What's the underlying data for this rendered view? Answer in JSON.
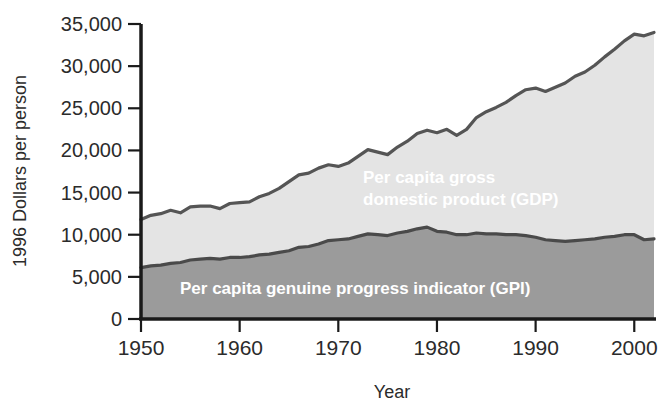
{
  "chart_data": {
    "type": "area",
    "title": "",
    "subtitle": "",
    "xlabel": "Year",
    "ylabel": "1996 Dollars per person",
    "xlim": [
      1950,
      2002
    ],
    "ylim": [
      0,
      35000
    ],
    "grid": false,
    "legend_position": "inline-annotations",
    "ytick_labels": [
      "35,000",
      "30,000",
      "25,000",
      "20,000",
      "15,000",
      "10,000",
      "5,000",
      "0"
    ],
    "ytick_values": [
      35000,
      30000,
      25000,
      20000,
      15000,
      10000,
      5000,
      0
    ],
    "xtick_labels": [
      "1950",
      "1960",
      "1970",
      "1980",
      "1990",
      "2000"
    ],
    "xtick_values": [
      1950,
      1960,
      1970,
      1980,
      1990,
      2000
    ],
    "colors": {
      "gdp_fill": "#e6e6e6",
      "gpi_fill": "#9b9b9b",
      "line": "#4a4a4a",
      "axis": "#1a1a1a",
      "label_text": "#ffffff",
      "tick_text": "#2b2b2b"
    },
    "x": [
      1950,
      1951,
      1952,
      1953,
      1954,
      1955,
      1956,
      1957,
      1958,
      1959,
      1960,
      1961,
      1962,
      1963,
      1964,
      1965,
      1966,
      1967,
      1968,
      1969,
      1970,
      1971,
      1972,
      1973,
      1974,
      1975,
      1976,
      1977,
      1978,
      1979,
      1980,
      1981,
      1982,
      1983,
      1984,
      1985,
      1986,
      1987,
      1988,
      1989,
      1990,
      1991,
      1992,
      1993,
      1994,
      1995,
      1996,
      1997,
      1998,
      1999,
      2000,
      2001,
      2002
    ],
    "series": [
      {
        "name": "Per capita gross domestic product (GDP)",
        "label_lines": [
          "Per capita gross",
          "domestic product (GDP)"
        ],
        "values": [
          11800,
          12300,
          12500,
          12900,
          12600,
          13300,
          13400,
          13400,
          13100,
          13700,
          13800,
          13900,
          14500,
          14900,
          15500,
          16300,
          17100,
          17300,
          17900,
          18300,
          18100,
          18500,
          19300,
          20100,
          19800,
          19500,
          20400,
          21100,
          22000,
          22400,
          22100,
          22500,
          21800,
          22500,
          23900,
          24600,
          25100,
          25700,
          26500,
          27200,
          27400,
          27000,
          27500,
          28000,
          28800,
          29300,
          30100,
          31100,
          32000,
          33000,
          33800,
          33600,
          34000
        ]
      },
      {
        "name": "Per capita genuine progress indicator (GPI)",
        "label_lines": [
          "Per capita genuine progress indicator (GPI)"
        ],
        "values": [
          6100,
          6300,
          6400,
          6600,
          6700,
          7000,
          7100,
          7200,
          7100,
          7300,
          7300,
          7400,
          7600,
          7700,
          7900,
          8100,
          8500,
          8600,
          8900,
          9300,
          9400,
          9500,
          9800,
          10100,
          10000,
          9900,
          10200,
          10400,
          10700,
          10900,
          10400,
          10300,
          10000,
          10000,
          10200,
          10100,
          10100,
          10000,
          10000,
          9900,
          9700,
          9400,
          9300,
          9200,
          9300,
          9400,
          9500,
          9700,
          9800,
          10000,
          10000,
          9400,
          9500
        ]
      }
    ]
  },
  "axes": {
    "y_title": "1996 Dollars per person",
    "x_title": "Year"
  },
  "annotations": {
    "gdp_line1": "Per capita gross",
    "gdp_line2": "domestic product (GDP)",
    "gpi_line1": "Per capita genuine progress indicator (GPI)"
  }
}
